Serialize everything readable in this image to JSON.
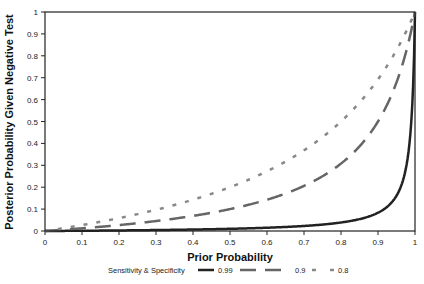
{
  "chart_data": {
    "type": "line",
    "title": "",
    "xlabel": "Prior Probability",
    "ylabel": "Posterior Probability Given Negative Test",
    "xlim": [
      0,
      1
    ],
    "ylim": [
      0,
      1
    ],
    "grid": false,
    "x_ticks": [
      "0",
      "0.1",
      "0.2",
      "0.3",
      "0.4",
      "0.5",
      "0.6",
      "0.7",
      "0.8",
      "0.9",
      "1"
    ],
    "y_ticks": [
      "0",
      "0.1",
      "0.2",
      "0.3",
      "0.4",
      "0.5",
      "0.6",
      "0.7",
      "0.8",
      "0.9",
      "1"
    ],
    "legend": {
      "title": "Sensitivity & Specificity",
      "position": "bottom",
      "entries": [
        "0.99",
        "0.9",
        "0.8"
      ]
    },
    "x": [
      0,
      0.1,
      0.2,
      0.3,
      0.4,
      0.5,
      0.6,
      0.7,
      0.8,
      0.9,
      0.95,
      0.99,
      1.0
    ],
    "series": [
      {
        "name": "0.99",
        "style": "solid",
        "color": "#222222",
        "values": [
          0,
          0.001,
          0.003,
          0.004,
          0.007,
          0.01,
          0.015,
          0.023,
          0.039,
          0.083,
          0.161,
          0.5,
          1.0
        ]
      },
      {
        "name": "0.9",
        "style": "long-dash",
        "color": "#666666",
        "values": [
          0,
          0.012,
          0.027,
          0.045,
          0.069,
          0.1,
          0.143,
          0.206,
          0.308,
          0.5,
          0.679,
          0.917,
          1.0
        ]
      },
      {
        "name": "0.8",
        "style": "short-dash",
        "color": "#888888",
        "values": [
          0,
          0.027,
          0.059,
          0.097,
          0.143,
          0.2,
          0.273,
          0.368,
          0.5,
          0.692,
          0.826,
          0.961,
          1.0
        ]
      }
    ]
  }
}
